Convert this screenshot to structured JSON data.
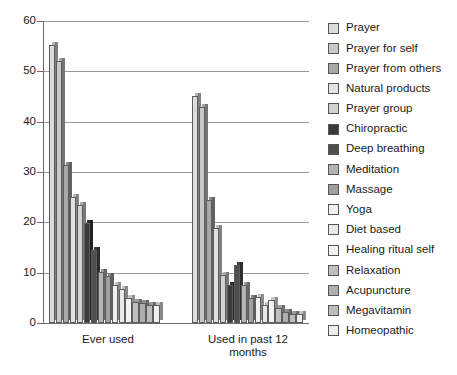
{
  "chart_data": {
    "type": "bar",
    "title": "",
    "xlabel": "",
    "ylabel": "",
    "ylim": [
      0,
      60
    ],
    "yticks": [
      0,
      10,
      20,
      30,
      40,
      50,
      60
    ],
    "ytick_labels": [
      "0",
      "10",
      "20",
      "30",
      "40",
      "50",
      "60"
    ],
    "grid": true,
    "legend_position": "right",
    "categories": [
      "Ever used",
      "Used in past 12 months"
    ],
    "series": [
      {
        "name": "Prayer",
        "color": "#dcdcdc",
        "values": [
          55.3,
          45.2
        ]
      },
      {
        "name": "Prayer for self",
        "color": "#c8c8c8",
        "values": [
          52.0,
          43.0
        ]
      },
      {
        "name": "Prayer from others",
        "color": "#a8a8a8",
        "values": [
          31.3,
          24.4
        ]
      },
      {
        "name": "Natural products",
        "color": "#e2e2e2",
        "values": [
          25.0,
          18.9
        ]
      },
      {
        "name": "Prayer group",
        "color": "#d2d2d2",
        "values": [
          23.5,
          9.6
        ]
      },
      {
        "name": "Chiropractic",
        "color": "#3a3a3a",
        "values": [
          19.9,
          7.5
        ]
      },
      {
        "name": "Deep breathing",
        "color": "#4f4f4f",
        "values": [
          14.6,
          11.6
        ]
      },
      {
        "name": "Meditation",
        "color": "#b4b4b4",
        "values": [
          10.2,
          7.6
        ]
      },
      {
        "name": "Massage",
        "color": "#a0a0a0",
        "values": [
          9.3,
          5.0
        ]
      },
      {
        "name": "Yoga",
        "color": "#efefef",
        "values": [
          7.5,
          5.1
        ]
      },
      {
        "name": "Diet based",
        "color": "#e8e8e8",
        "values": [
          6.8,
          3.5
        ]
      },
      {
        "name": "Healing ritual self",
        "color": "#f2f2f2",
        "values": [
          5.0,
          4.6
        ]
      },
      {
        "name": "Relaxation",
        "color": "#c0c0c0",
        "values": [
          4.2,
          3.0
        ]
      },
      {
        "name": "Acupuncture",
        "color": "#aeaeae",
        "values": [
          4.0,
          2.1
        ]
      },
      {
        "name": "Megavitamin",
        "color": "#bcbcbc",
        "values": [
          3.5,
          1.8
        ]
      },
      {
        "name": "Homeopathic",
        "color": "#ededed",
        "values": [
          3.6,
          1.7
        ]
      }
    ]
  },
  "caption": ""
}
